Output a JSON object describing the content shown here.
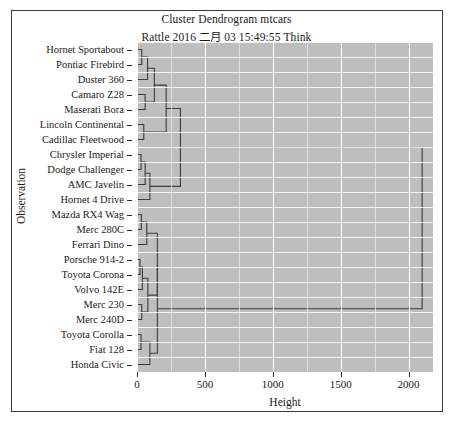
{
  "chart_data": {
    "type": "dendrogram",
    "title": "Cluster Dendrogram mtcars",
    "subtitle": "Rattle 2016 二月 03 15:49:55 Think",
    "xlabel": "Height",
    "ylabel": "Observation",
    "xlim": [
      0,
      2180
    ],
    "xticks": [
      0,
      500,
      1000,
      1500,
      2000
    ],
    "xticklabels": [
      "0",
      "500",
      "1000",
      "1500",
      "2000"
    ],
    "grid": "major-and-minor-white-on-grey",
    "orientation": "horizontal",
    "leaves": [
      "Hornet Sportabout",
      "Pontiac Firebird",
      "Duster 360",
      "Camaro Z28",
      "Maserati Bora",
      "Lincoln Continental",
      "Cadillac Fleetwood",
      "Chrysler Imperial",
      "Dodge Challenger",
      "AMC Javelin",
      "Hornet 4 Drive",
      "Mazda RX4 Wag",
      "Merc 280C",
      "Ferrari Dino",
      "Porsche 914-2",
      "Toyota Corona",
      "Volvo 142E",
      "Merc 230",
      "Merc 240D",
      "Toyota Corolla",
      "Fiat 128",
      "Honda Civic"
    ],
    "merges": [
      {
        "id": "m1",
        "children": [
          "Hornet Sportabout",
          "Pontiac Firebird"
        ],
        "height": 35
      },
      {
        "id": "m2",
        "children": [
          "m1",
          "Duster 360"
        ],
        "height": 78
      },
      {
        "id": "m3",
        "children": [
          "Camaro Z28",
          "Maserati Bora"
        ],
        "height": 60
      },
      {
        "id": "m4",
        "children": [
          "m2",
          "m3"
        ],
        "height": 128
      },
      {
        "id": "m5",
        "children": [
          "Lincoln Continental",
          "Cadillac Fleetwood"
        ],
        "height": 50
      },
      {
        "id": "m6",
        "children": [
          "m4",
          "m5"
        ],
        "height": 215
      },
      {
        "id": "m7",
        "children": [
          "Chrysler Imperial",
          "Dodge Challenger"
        ],
        "height": 30
      },
      {
        "id": "m8",
        "children": [
          "m7",
          "AMC Javelin"
        ],
        "height": 60
      },
      {
        "id": "m9",
        "children": [
          "m8",
          "Hornet 4 Drive"
        ],
        "height": 95
      },
      {
        "id": "m10",
        "children": [
          "m6",
          "m9"
        ],
        "height": 320
      },
      {
        "id": "m11",
        "children": [
          "Mazda RX4 Wag",
          "Merc 280C"
        ],
        "height": 32
      },
      {
        "id": "m12",
        "children": [
          "m11",
          "Ferrari Dino"
        ],
        "height": 72
      },
      {
        "id": "m13",
        "children": [
          "Porsche 914-2",
          "Toyota Corona"
        ],
        "height": 22
      },
      {
        "id": "m14",
        "children": [
          "m13",
          "Volvo 142E"
        ],
        "height": 40
      },
      {
        "id": "m15",
        "children": [
          "Merc 230",
          "Merc 240D"
        ],
        "height": 35
      },
      {
        "id": "m16",
        "children": [
          "m14",
          "m15"
        ],
        "height": 80
      },
      {
        "id": "m17",
        "children": [
          "m12",
          "m16"
        ],
        "height": 150
      },
      {
        "id": "m18",
        "children": [
          "Toyota Corolla",
          "Fiat 128"
        ],
        "height": 30
      },
      {
        "id": "m19",
        "children": [
          "m18",
          "Honda Civic"
        ],
        "height": 95
      },
      {
        "id": "m20",
        "children": [
          "m17",
          "m19"
        ],
        "height": 150
      },
      {
        "id": "root",
        "children": [
          "m10",
          "m20"
        ],
        "height": 2100
      }
    ],
    "panel_background": "#bebebe",
    "gridline_color": "#ffffff",
    "line_color": "#3c3c3c"
  },
  "axis": {
    "x_title": "Height",
    "y_title": "Observation"
  }
}
